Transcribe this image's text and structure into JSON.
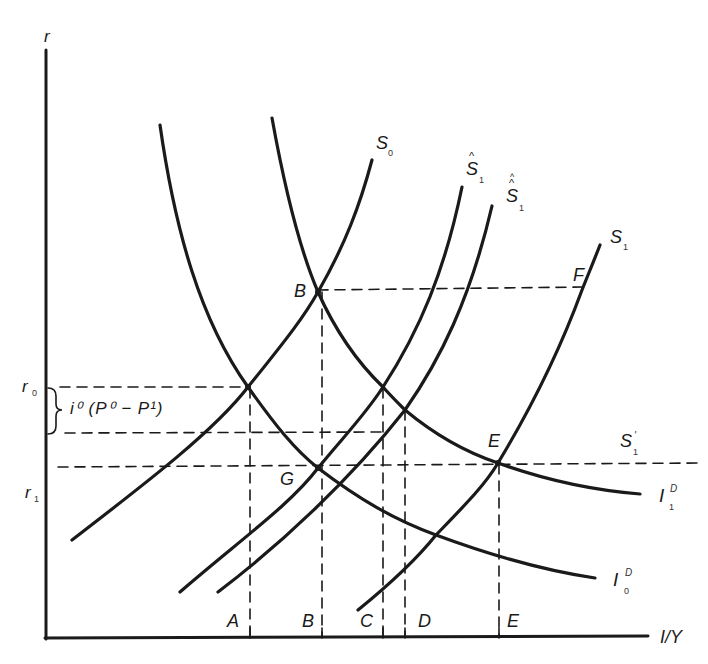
{
  "diagram": {
    "axes": {
      "y_label": "r",
      "x_label": "I/Y"
    },
    "rate_levels": [
      {
        "label": "r",
        "sub": "0"
      },
      {
        "label": "r",
        "sub": "1"
      }
    ],
    "bracket_annotation": "i⁰ (P⁰ − P¹)",
    "curves": {
      "S0": {
        "label": "S",
        "sub": "0"
      },
      "S1_hat": {
        "label": "S",
        "sub": "1",
        "accent": "^"
      },
      "S1_double_hat": {
        "label": "S",
        "sub": "1",
        "accent": "^^"
      },
      "S1": {
        "label": "S",
        "sub": "1"
      },
      "S1_prime": {
        "label": "S",
        "sub": "1",
        "sup": "'"
      },
      "I1D": {
        "label": "I",
        "sub": "1",
        "sup": "D"
      },
      "I0D": {
        "label": "I",
        "sub": "0",
        "sup": "D"
      }
    },
    "points": {
      "B": "B",
      "G": "G",
      "E": "E",
      "F": "F"
    },
    "x_markers": [
      "A",
      "B",
      "C",
      "D",
      "E"
    ],
    "colors": {
      "ink": "#1a1a1a",
      "background": "#ffffff"
    }
  }
}
